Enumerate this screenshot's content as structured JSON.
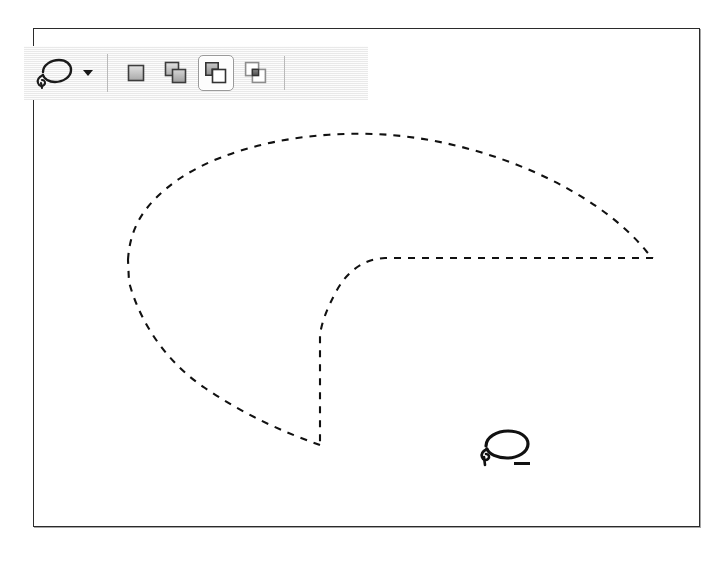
{
  "app": {
    "context": "image-editor-lasso-selection",
    "canvas_background": "#ffffff",
    "frame_border_color": "#2b2b2b",
    "toolbar_background": "#f0f0f0",
    "ant_stroke_color": "#111111"
  },
  "options_bar": {
    "tool_chooser": {
      "name": "Lasso Tool",
      "icon": "lasso-icon",
      "dropdown_icon": "chevron-down-icon"
    },
    "separators": [
      {
        "index": 1
      },
      {
        "index": 2
      }
    ],
    "selection_modes": {
      "label": "Selection mode",
      "items": [
        {
          "id": "new",
          "label": "New selection",
          "icon": "new-selection-icon",
          "selected": false
        },
        {
          "id": "add",
          "label": "Add to selection",
          "icon": "add-to-selection-icon",
          "selected": false
        },
        {
          "id": "subtract",
          "label": "Subtract from selection",
          "icon": "subtract-from-selection-icon",
          "selected": true
        },
        {
          "id": "intersect",
          "label": "Intersect with selection",
          "icon": "intersect-selection-icon",
          "selected": false
        }
      ],
      "active_mode": "subtract"
    }
  },
  "canvas": {
    "label": "Image canvas",
    "selection": {
      "label": "Active lasso selection marquee",
      "style": "marching-ants-dashed",
      "description": "Pie / pac-man shaped selection with a wedge removed from the lower middle",
      "outer_path": "M 95 232 C 97 196 116 172 150 149 C 205 112 292 99 370 106 C 470 115 570 160 618 226 L 622 230",
      "wedge_path": "M 622 230 L 338 230 C 318 231 305 245 296 262 C 290 274 288 288 287 300 L 287 417",
      "lower_path": "M 287 417 L 280 417 C 240 400 200 382 160 356 C 128 334 104 300 95 258 Z"
    },
    "cursor": {
      "label": "Lasso cursor, subtract mode",
      "icon": "lasso-subtract-cursor-icon",
      "x": 470,
      "y": 424
    }
  }
}
